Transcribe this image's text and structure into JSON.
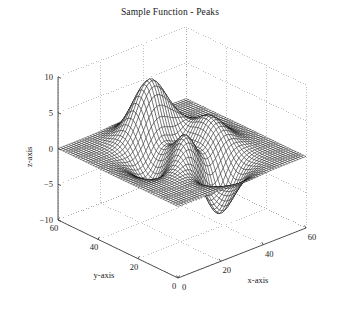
{
  "figure": {
    "title": "Sample Function - Peaks",
    "background": "#ffffff",
    "mesh_color": "#000000",
    "axis_color": "#404040",
    "grid_color": "#999999"
  },
  "axes": {
    "x": {
      "label": "x-axis",
      "ticks": [
        "0",
        "20",
        "40",
        "60"
      ],
      "range": [
        0,
        60
      ]
    },
    "y": {
      "label": "y-axis",
      "ticks": [
        "0",
        "20",
        "40",
        "60"
      ],
      "range": [
        0,
        60
      ]
    },
    "z": {
      "label": "z-axis",
      "ticks": [
        "10",
        "5",
        "0",
        "-5",
        "-10"
      ],
      "range": [
        -10,
        10
      ]
    }
  },
  "chart_data": {
    "type": "surface",
    "title": "Sample Function - Peaks",
    "xlabel": "x-axis",
    "ylabel": "y-axis",
    "zlabel": "z-axis",
    "xlim": [
      0,
      60
    ],
    "ylim": [
      0,
      60
    ],
    "zlim": [
      -10,
      10
    ],
    "xticks": [
      0,
      20,
      40,
      60
    ],
    "yticks": [
      0,
      20,
      40,
      60
    ],
    "zticks": [
      -10,
      -5,
      0,
      5,
      10
    ],
    "grid": true,
    "legend": null,
    "render": "wireframe-mesh",
    "grid_n": 49,
    "function": "peaks",
    "formula": "z = 3*(1-u)^2*exp(-u^2-(v+1)^2) - 10*(u/5 - u^3 - v^5)*exp(-u^2-v^2) - (1/3)*exp(-(u+1)^2 - v^2), with u,v mapped linearly from [0,60] to [-3,3]",
    "features": [
      {
        "name": "main-peak",
        "x": 26,
        "y": 34,
        "z": 7.9
      },
      {
        "name": "secondary-peak",
        "x": 41,
        "y": 22,
        "z": 3.3
      },
      {
        "name": "deep-valley",
        "x": 34,
        "y": 21,
        "z": -6.5
      },
      {
        "name": "shallow-dip",
        "x": 19,
        "y": 38,
        "z": -3.1
      }
    ],
    "view": {
      "azimuth": -37.5,
      "elevation": 30
    }
  }
}
